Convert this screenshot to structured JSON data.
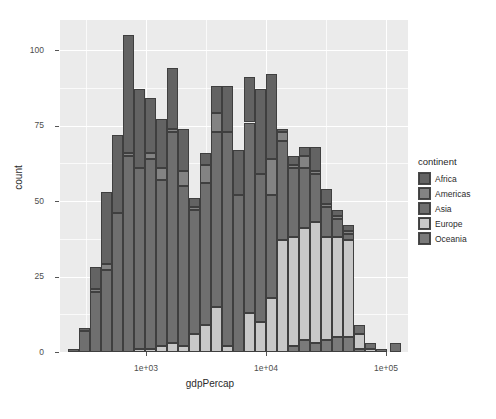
{
  "chart_data": {
    "type": "bar",
    "title": "",
    "subtitle": "",
    "xlabel": "gdpPercap",
    "ylabel": "count",
    "stacked": true,
    "grid": true,
    "legend_position": "right",
    "legend_title": "continent",
    "x_scale": "log10",
    "xlim": [
      330,
      150000
    ],
    "ylim": [
      0,
      110
    ],
    "x_tick_labels": [
      "1e+03",
      "1e+04",
      "1e+05"
    ],
    "x_tick_values": [
      1000,
      10000,
      100000
    ],
    "y_tick_labels": [
      "0",
      "25",
      "50",
      "75",
      "100"
    ],
    "y_tick_values": [
      0,
      25,
      50,
      75,
      100
    ],
    "series": [
      {
        "name": "Africa",
        "color": "#636363",
        "values": [
          1,
          1,
          7,
          24,
          26,
          39,
          26,
          18,
          16,
          20,
          14,
          3,
          4,
          9,
          15,
          15,
          15,
          28,
          28,
          1,
          3,
          3,
          8,
          5,
          2,
          2,
          0,
          0,
          0,
          0,
          0,
          0,
          0
        ]
      },
      {
        "name": "Americas",
        "color": "#838383",
        "values": [
          0,
          0,
          1,
          2,
          0,
          1,
          0,
          2,
          4,
          1,
          5,
          1,
          6,
          6,
          0,
          0,
          0,
          0,
          12,
          3,
          1,
          4,
          1,
          1,
          1,
          1,
          0,
          0,
          0,
          0,
          0,
          0,
          0
        ]
      },
      {
        "name": "Asia",
        "color": "#6f6f6f",
        "values": [
          0,
          7,
          20,
          27,
          46,
          65,
          60,
          63,
          55,
          70,
          53,
          41,
          47,
          58,
          71,
          52,
          63,
          49,
          34,
          33,
          23,
          20,
          16,
          10,
          6,
          2,
          3,
          2,
          1,
          0,
          0,
          1,
          3
        ]
      },
      {
        "name": "Europe",
        "color": "#c8c8c8",
        "values": [
          0,
          0,
          0,
          0,
          0,
          0,
          1,
          1,
          2,
          3,
          2,
          6,
          9,
          15,
          2,
          0,
          13,
          10,
          18,
          37,
          36,
          37,
          40,
          34,
          33,
          32,
          5,
          1,
          0,
          0,
          0,
          0,
          0
        ]
      },
      {
        "name": "Oceania",
        "color": "#7a7a7a",
        "values": [
          0,
          0,
          0,
          0,
          0,
          0,
          0,
          0,
          0,
          0,
          0,
          0,
          0,
          0,
          0,
          0,
          0,
          0,
          0,
          0,
          2,
          4,
          3,
          4,
          5,
          5,
          1,
          0,
          0,
          0,
          0,
          0,
          0
        ]
      }
    ],
    "bin_centers_px": [
      73.5,
      84.5,
      95.5,
      106.5,
      117.5,
      128.5,
      139.5,
      150.5,
      161.5,
      172.5,
      183.5,
      194.5,
      205.5,
      216.5,
      227.5,
      238.5,
      249.5,
      260.5,
      271.5,
      282.5,
      293.5,
      304.5,
      315.5,
      326.5,
      337.5,
      348.5,
      359.5,
      370.5,
      381.5,
      392.5,
      403.5,
      414.5,
      395.5
    ],
    "bin_totals": [
      1,
      8,
      28,
      53,
      72,
      105,
      87,
      84,
      77,
      94,
      74,
      51,
      66,
      88,
      88,
      67,
      91,
      87,
      92,
      74,
      65,
      68,
      68,
      54,
      47,
      42,
      9,
      3,
      1,
      0,
      0,
      1,
      3
    ]
  },
  "legend": {
    "title": "continent",
    "items": [
      {
        "label": "Africa",
        "color": "#636363"
      },
      {
        "label": "Americas",
        "color": "#838383"
      },
      {
        "label": "Asia",
        "color": "#6f6f6f"
      },
      {
        "label": "Europe",
        "color": "#c8c8c8"
      },
      {
        "label": "Oceania",
        "color": "#7a7a7a"
      }
    ]
  },
  "axes": {
    "x_title": "gdpPercap",
    "y_title": "count",
    "x_ticks": [
      {
        "label": "1e+03",
        "px": 146
      },
      {
        "label": "1e+04",
        "px": 266
      },
      {
        "label": "1e+05",
        "px": 386
      }
    ],
    "y_ticks": [
      {
        "label": "0",
        "px": 352
      },
      {
        "label": "25",
        "px": 276.5
      },
      {
        "label": "50",
        "px": 201
      },
      {
        "label": "75",
        "px": 125.5
      },
      {
        "label": "100",
        "px": 50
      }
    ]
  },
  "panel": {
    "background": "#ebebeb",
    "gridline_color": "#ffffff",
    "left_px": 60,
    "top_px": 20,
    "width_px": 348,
    "height_px": 332
  }
}
